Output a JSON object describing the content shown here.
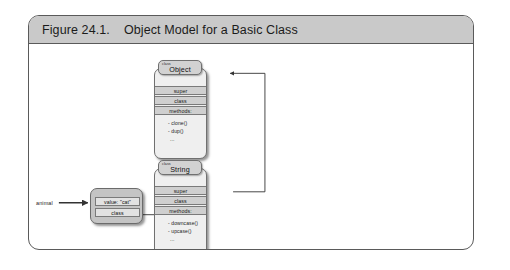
{
  "figure": {
    "number": "Figure 24.1.",
    "title": "Object Model for a Basic Class"
  },
  "diagram": {
    "instance": {
      "variable_label": "animal",
      "rows": [
        {
          "label": "value: \"cat\""
        },
        {
          "label": "class"
        }
      ]
    },
    "classes": [
      {
        "id": "object-class",
        "kind_label": "class",
        "name": "Object",
        "rows": [
          {
            "label": "super"
          },
          {
            "label": "class"
          },
          {
            "label": "methods:"
          }
        ],
        "methods": [
          "- clone()",
          "- dup()",
          "..."
        ]
      },
      {
        "id": "string-class",
        "kind_label": "class",
        "name": "String",
        "rows": [
          {
            "label": "super"
          },
          {
            "label": "class"
          },
          {
            "label": "methods:"
          }
        ],
        "methods": [
          "- downcase()",
          "- upcase()",
          "..."
        ]
      }
    ],
    "connections": [
      {
        "name": "animal-to-instance",
        "from": "animal",
        "to": "instance"
      },
      {
        "name": "instance-class-to-string",
        "from": "instance.class",
        "to": "String"
      },
      {
        "name": "string-super-to-object",
        "from": "String.super",
        "to": "Object"
      }
    ]
  },
  "colors": {
    "frame_border": "#5a5a5a",
    "caption_bar": "#c9c9c9",
    "class_box_fill": "#efefef",
    "class_tab_fill": "#d2d2d2",
    "row_fill": "#cfcfcf",
    "instance_fill": "#c4c4c4",
    "instance_row_fill": "#e2e2e2",
    "connector": "#333333"
  }
}
